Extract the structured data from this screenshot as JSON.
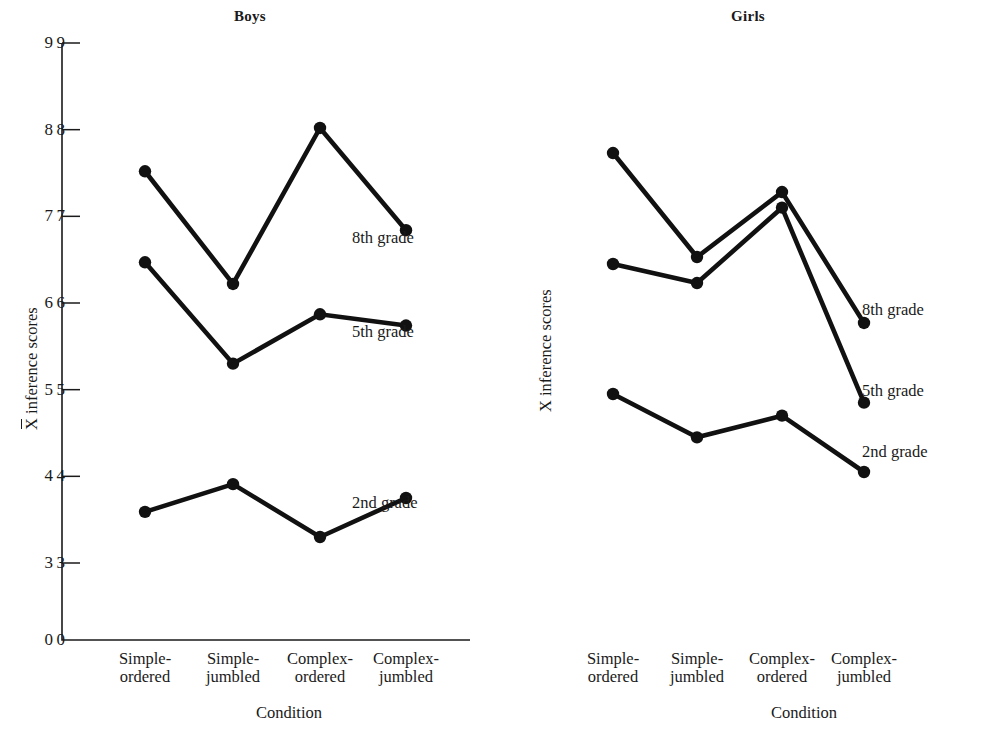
{
  "figure": {
    "background": "#ffffff",
    "ink_color": "#111111"
  },
  "panels": [
    {
      "key": "boys",
      "title": "Boys",
      "ylabel_prefix": "X",
      "ylabel_has_overbar": true,
      "ylabel_suffix": " inference scores",
      "xlabel": "Condition",
      "series_labels": [
        "8th grade",
        "5th grade",
        "2nd grade"
      ]
    },
    {
      "key": "girls",
      "title": "Girls",
      "ylabel_prefix": "X",
      "ylabel_has_overbar": false,
      "ylabel_suffix": " inference scores",
      "xlabel": "Condition",
      "series_labels": [
        "8th grade",
        "5th grade",
        "2nd grade"
      ]
    }
  ],
  "chart_data": [
    {
      "type": "line",
      "title": "Boys",
      "xlabel": "Condition",
      "ylabel": "X̄ inference scores",
      "categories": [
        "Simple-ordered",
        "Simple-jumbled",
        "Complex-ordered",
        "Complex-jumbled"
      ],
      "category_lines": [
        [
          "Simple-",
          "ordered"
        ],
        [
          "Simple-",
          "jumbled"
        ],
        [
          "Complex-",
          "ordered"
        ],
        [
          "Complex-",
          "jumbled"
        ]
      ],
      "yticks": [
        0,
        3,
        4,
        5,
        6,
        7,
        8,
        9
      ],
      "ylim": [
        0,
        9
      ],
      "axis_break": true,
      "grid": false,
      "legend_position": "right-inline",
      "series": [
        {
          "name": "8th grade",
          "values": [
            7.52,
            6.22,
            8.02,
            6.84
          ]
        },
        {
          "name": "5th grade",
          "values": [
            6.47,
            5.3,
            5.87,
            5.74
          ]
        },
        {
          "name": "2nd grade",
          "values": [
            3.59,
            3.91,
            3.3,
            3.75
          ]
        }
      ]
    },
    {
      "type": "line",
      "title": "Girls",
      "xlabel": "Condition",
      "ylabel": "X inference scores",
      "categories": [
        "Simple-ordered",
        "Simple-jumbled",
        "Complex-ordered",
        "Complex-jumbled"
      ],
      "category_lines": [
        [
          "Simple-",
          "ordered"
        ],
        [
          "Simple-",
          "jumbled"
        ],
        [
          "Complex-",
          "ordered"
        ],
        [
          "Complex-",
          "jumbled"
        ]
      ],
      "yticks": [
        0,
        3,
        4,
        5,
        6,
        7,
        8,
        9
      ],
      "ylim": [
        0,
        9
      ],
      "axis_break": true,
      "grid": false,
      "legend_position": "right-inline",
      "series": [
        {
          "name": "8th grade",
          "values": [
            7.73,
            6.53,
            7.28,
            5.77
          ]
        },
        {
          "name": "5th grade",
          "values": [
            6.45,
            6.23,
            7.1,
            4.85
          ]
        },
        {
          "name": "2nd grade",
          "values": [
            4.95,
            4.45,
            4.7,
            4.05
          ]
        }
      ]
    }
  ]
}
